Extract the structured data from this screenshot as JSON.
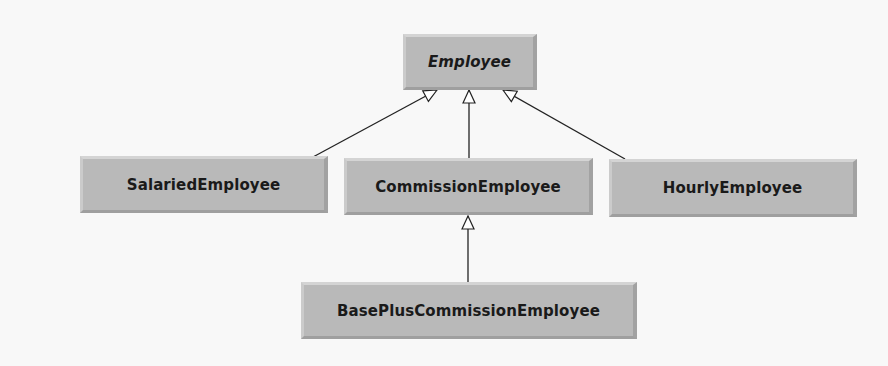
{
  "diagram": {
    "type": "uml-class-hierarchy",
    "classes": [
      {
        "id": "employee",
        "name": "Employee",
        "abstract": true
      },
      {
        "id": "salaried",
        "name": "SalariedEmployee",
        "abstract": false
      },
      {
        "id": "commission",
        "name": "CommissionEmployee",
        "abstract": false
      },
      {
        "id": "hourly",
        "name": "HourlyEmployee",
        "abstract": false
      },
      {
        "id": "basePlus",
        "name": "BasePlusCommissionEmployee",
        "abstract": false
      }
    ],
    "relationships": [
      {
        "type": "generalization",
        "from": "SalariedEmployee",
        "to": "Employee"
      },
      {
        "type": "generalization",
        "from": "CommissionEmployee",
        "to": "Employee"
      },
      {
        "type": "generalization",
        "from": "HourlyEmployee",
        "to": "Employee"
      },
      {
        "type": "generalization",
        "from": "BasePlusCommissionEmployee",
        "to": "CommissionEmployee"
      }
    ],
    "colors": {
      "background": "#f8f8f8",
      "box_fill": "#b9b9b9",
      "text": "#1a1a1a",
      "line": "#222222"
    }
  }
}
